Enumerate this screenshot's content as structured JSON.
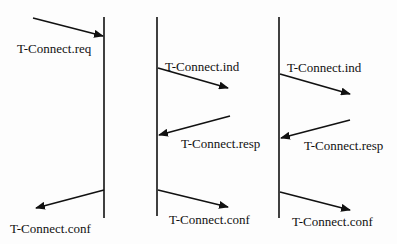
{
  "diagram": {
    "type": "sequence",
    "scenarios": [
      {
        "id": "a",
        "messages": [
          {
            "label": "T-Connect.req",
            "direction": "incoming"
          },
          {
            "label": "T-Connect.conf",
            "direction": "outgoing"
          }
        ]
      },
      {
        "id": "b",
        "messages": [
          {
            "label": "T-Connect.ind",
            "direction": "outgoing"
          },
          {
            "label": "T-Connect.resp",
            "direction": "incoming"
          },
          {
            "label": "T-Connect.conf",
            "direction": "outgoing"
          }
        ]
      },
      {
        "id": "c",
        "messages": [
          {
            "label": "T-Connect.ind",
            "direction": "outgoing"
          },
          {
            "label": "T-Connect.resp",
            "direction": "incoming"
          },
          {
            "label": "T-Connect.conf",
            "direction": "outgoing"
          }
        ]
      }
    ]
  }
}
